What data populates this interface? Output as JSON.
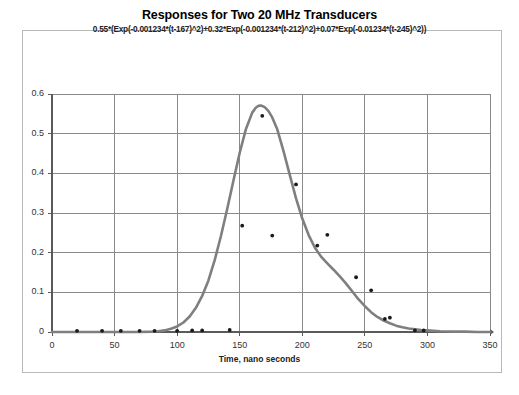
{
  "chart_data": {
    "type": "line",
    "title": "Responses for Two 20 MHz Transducers",
    "subtitle": "0.55*(Exp(-0.001234*(t-167)^2)+0.32*Exp(-0.001234*(t-212)^2)+0.07*Exp(-0.01234*(t-245)^2))",
    "xlabel": "Time, nano seconds",
    "ylabel": "",
    "xlim": [
      0,
      350
    ],
    "ylim": [
      0,
      0.6
    ],
    "xticks": [
      0,
      50,
      100,
      150,
      200,
      250,
      300,
      350
    ],
    "xtick_labels": [
      "0",
      "50",
      "100",
      "150",
      "200",
      "250",
      "300",
      "350"
    ],
    "yticks": [
      0,
      0.1,
      0.2,
      0.3,
      0.4,
      0.5,
      0.6
    ],
    "ytick_labels": [
      "0",
      "0.1",
      "0.2",
      "0.3",
      "0.4",
      "0.5",
      "0.6"
    ],
    "grid": true,
    "legend": false,
    "series": [
      {
        "name": "model-curve",
        "type": "line",
        "color": "#7f7f7f",
        "marker": "none",
        "x": [
          0,
          10,
          20,
          30,
          40,
          50,
          60,
          70,
          80,
          85,
          90,
          95,
          100,
          105,
          110,
          115,
          120,
          125,
          130,
          135,
          140,
          145,
          150,
          155,
          160,
          163,
          165,
          167,
          170,
          173,
          176,
          180,
          185,
          190,
          195,
          200,
          205,
          210,
          215,
          220,
          225,
          230,
          235,
          240,
          245,
          250,
          255,
          260,
          265,
          270,
          275,
          280,
          285,
          290,
          295,
          300,
          310,
          320,
          330,
          340,
          350
        ],
        "y": [
          0,
          0,
          0,
          0,
          0,
          0,
          0,
          0,
          0.001,
          0.002,
          0.004,
          0.008,
          0.014,
          0.024,
          0.039,
          0.061,
          0.091,
          0.13,
          0.181,
          0.242,
          0.31,
          0.382,
          0.452,
          0.512,
          0.553,
          0.566,
          0.57,
          0.571,
          0.567,
          0.557,
          0.541,
          0.511,
          0.456,
          0.396,
          0.337,
          0.286,
          0.245,
          0.213,
          0.19,
          0.173,
          0.157,
          0.14,
          0.122,
          0.102,
          0.082,
          0.065,
          0.05,
          0.038,
          0.029,
          0.022,
          0.016,
          0.012,
          0.009,
          0.007,
          0.005,
          0.004,
          0.002,
          0.001,
          0.001,
          0,
          0
        ]
      },
      {
        "name": "measured-points",
        "type": "scatter",
        "color": "#1a1a1a",
        "marker": "dot",
        "x": [
          20,
          40,
          55,
          70,
          82,
          100,
          112,
          120,
          142,
          152,
          168,
          176,
          195,
          212,
          220,
          243,
          255,
          266,
          270,
          290,
          297
        ],
        "y": [
          0.003,
          0.003,
          0.003,
          0.003,
          0.003,
          0.003,
          0.004,
          0.004,
          0.005,
          0.268,
          0.545,
          0.243,
          0.372,
          0.218,
          0.245,
          0.138,
          0.105,
          0.033,
          0.036,
          0.004,
          0.004
        ]
      }
    ]
  },
  "axes": {
    "x_title": "Time, nano seconds"
  }
}
